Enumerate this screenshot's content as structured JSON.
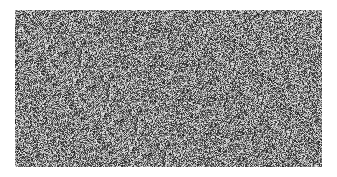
{
  "canvas": {
    "width": 337,
    "height": 177,
    "background": "#ffffff"
  },
  "noise_panel": {
    "x": 15,
    "y": 10,
    "width": 307,
    "height": 157,
    "description": "grayscale random noise texture",
    "base_gray": 128,
    "gray_min": 30,
    "gray_max": 235
  }
}
